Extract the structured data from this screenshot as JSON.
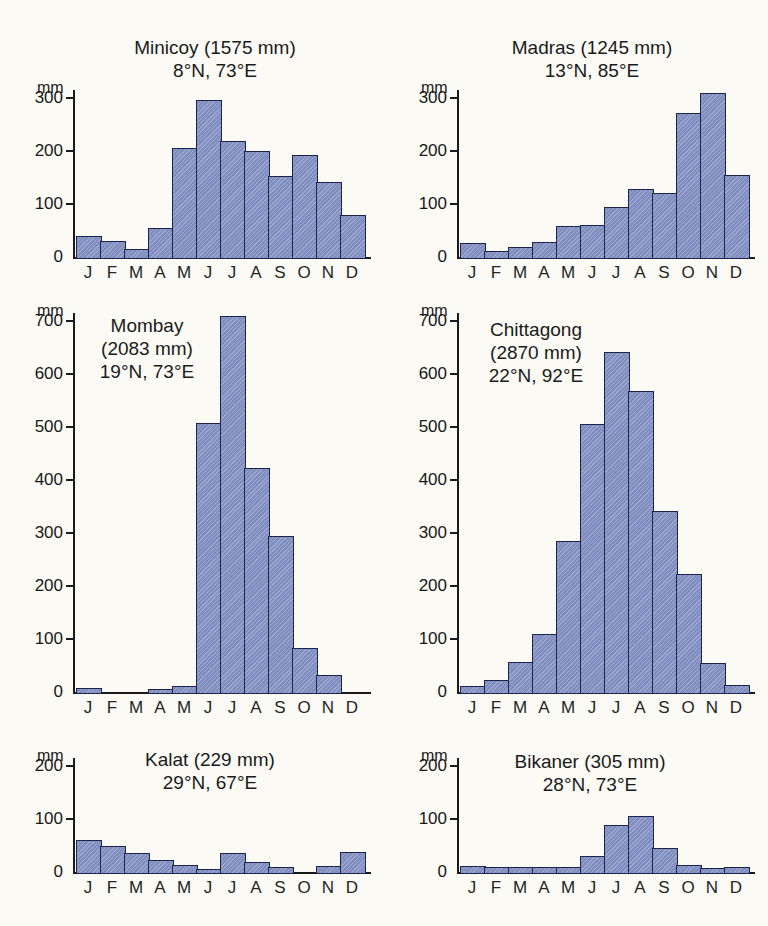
{
  "figure": {
    "description_unit": "mm",
    "background_color": "#fbfaf5",
    "bar_fill_color": "#8391c4",
    "bar_border_color": "#1c244e",
    "axis_color": "#1a1a1a",
    "text_color": "#1b1b1b"
  },
  "chart_data": [
    {
      "type": "bar",
      "id": "minicoy",
      "title_lines": [
        "Minicoy (1575 mm)",
        "8°N, 73°E"
      ],
      "station": "Minicoy",
      "annual_total": "1575 mm",
      "coordinates": "8°N, 73°E",
      "unit": "mm",
      "categories": [
        "J",
        "F",
        "M",
        "A",
        "M",
        "J",
        "J",
        "A",
        "S",
        "O",
        "N",
        "D"
      ],
      "values": [
        40,
        30,
        15,
        55,
        205,
        297,
        218,
        200,
        153,
        192,
        141,
        79
      ],
      "ylim": [
        0,
        300
      ],
      "yticks": [
        0,
        100,
        200,
        300
      ],
      "xlabel": "",
      "ylabel": "mm",
      "grid": false,
      "legend": "none"
    },
    {
      "type": "bar",
      "id": "madras",
      "title_lines": [
        "Madras (1245 mm)",
        "13°N, 85°E"
      ],
      "station": "Madras",
      "annual_total": "1245 mm",
      "coordinates": "13°N, 85°E",
      "unit": "mm",
      "categories": [
        "J",
        "F",
        "M",
        "A",
        "M",
        "J",
        "J",
        "A",
        "S",
        "O",
        "N",
        "D"
      ],
      "values": [
        27,
        12,
        18,
        28,
        58,
        60,
        95,
        128,
        120,
        272,
        310,
        155
      ],
      "ylim": [
        0,
        300
      ],
      "yticks": [
        0,
        100,
        200,
        300
      ],
      "xlabel": "",
      "ylabel": "mm",
      "grid": false,
      "legend": "none"
    },
    {
      "type": "bar",
      "id": "mombay",
      "title_lines": [
        "Mombay",
        "(2083 mm)",
        "19°N, 73°E"
      ],
      "station": "Mombay",
      "annual_total": "2083 mm",
      "coordinates": "19°N, 73°E",
      "unit": "mm",
      "categories": [
        "J",
        "F",
        "M",
        "A",
        "M",
        "J",
        "J",
        "A",
        "S",
        "O",
        "N",
        "D"
      ],
      "values": [
        8,
        0,
        0,
        5,
        12,
        507,
        710,
        422,
        295,
        83,
        33,
        0
      ],
      "ylim": [
        0,
        700
      ],
      "yticks": [
        0,
        100,
        200,
        300,
        400,
        500,
        600,
        700
      ],
      "xlabel": "",
      "ylabel": "mm",
      "grid": false,
      "legend": "none"
    },
    {
      "type": "bar",
      "id": "chittagong",
      "title_lines": [
        "Chittagong",
        "(2870 mm)",
        "22°N, 92°E"
      ],
      "station": "Chittagong",
      "annual_total": "2870 mm",
      "coordinates": "22°N, 92°E",
      "unit": "mm",
      "categories": [
        "J",
        "F",
        "M",
        "A",
        "M",
        "J",
        "J",
        "A",
        "S",
        "O",
        "N",
        "D"
      ],
      "values": [
        12,
        22,
        57,
        110,
        285,
        505,
        642,
        568,
        342,
        222,
        55,
        13
      ],
      "ylim": [
        0,
        700
      ],
      "yticks": [
        0,
        100,
        200,
        300,
        400,
        500,
        600,
        700
      ],
      "xlabel": "",
      "ylabel": "mm",
      "grid": false,
      "legend": "none"
    },
    {
      "type": "bar",
      "id": "kalat",
      "title_lines": [
        "Kalat (229 mm)",
        "29°N, 67°E"
      ],
      "station": "Kalat",
      "annual_total": "229 mm",
      "coordinates": "29°N, 67°E",
      "unit": "mm",
      "categories": [
        "J",
        "F",
        "M",
        "A",
        "M",
        "J",
        "J",
        "A",
        "S",
        "O",
        "N",
        "D"
      ],
      "values": [
        60,
        49,
        36,
        23,
        14,
        6,
        35,
        18,
        9,
        0,
        11,
        38
      ],
      "ylim": [
        0,
        200
      ],
      "yticks": [
        0,
        100,
        200
      ],
      "xlabel": "",
      "ylabel": "mm",
      "grid": false,
      "legend": "none"
    },
    {
      "type": "bar",
      "id": "bikaner",
      "title_lines": [
        "Bikaner (305 mm)",
        "28°N, 73°E"
      ],
      "station": "Bikaner",
      "annual_total": "305 mm",
      "coordinates": "28°N, 73°E",
      "unit": "mm",
      "categories": [
        "J",
        "F",
        "M",
        "A",
        "M",
        "J",
        "J",
        "A",
        "S",
        "O",
        "N",
        "D"
      ],
      "values": [
        11,
        10,
        10,
        10,
        9,
        31,
        88,
        105,
        45,
        13,
        7,
        9
      ],
      "ylim": [
        0,
        200
      ],
      "yticks": [
        0,
        100,
        200
      ],
      "xlabel": "",
      "ylabel": "mm",
      "grid": false,
      "legend": "none"
    }
  ]
}
